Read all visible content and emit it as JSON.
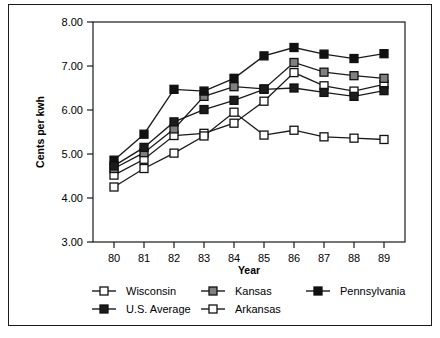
{
  "chart_data": {
    "type": "line",
    "title": "",
    "xlabel": "Year",
    "ylabel": "Cents per kwh",
    "categories": [
      "80",
      "81",
      "82",
      "83",
      "84",
      "85",
      "86",
      "87",
      "88",
      "89"
    ],
    "xlim": [
      0,
      9
    ],
    "ylim": [
      3.0,
      8.0
    ],
    "ytick_labels": [
      "3.00",
      "4.00",
      "5.00",
      "6.00",
      "7.00",
      "8.00"
    ],
    "ytick_values": [
      3.0,
      4.0,
      5.0,
      6.0,
      7.0,
      8.0
    ],
    "grid": false,
    "legend_position": "bottom",
    "series": [
      {
        "name": "Wisconsin",
        "marker": "open-square",
        "fill": "#ffffff",
        "values": [
          4.52,
          4.88,
          5.42,
          5.47,
          5.7,
          6.2,
          6.85,
          6.55,
          6.43,
          6.58
        ]
      },
      {
        "name": "Kansas",
        "marker": "gray-square",
        "fill": "#808080",
        "values": [
          4.67,
          5.03,
          5.57,
          6.31,
          6.53,
          6.48,
          7.08,
          6.86,
          6.78,
          6.72
        ]
      },
      {
        "name": "Pennsylvania",
        "marker": "black-square",
        "fill": "#111111",
        "values": [
          4.86,
          5.45,
          6.47,
          6.43,
          6.72,
          7.23,
          7.42,
          7.27,
          7.17,
          7.28
        ]
      },
      {
        "name": "U.S. Average",
        "marker": "dark-square",
        "fill": "#1c1c1c",
        "values": [
          4.73,
          5.15,
          5.73,
          6.01,
          6.22,
          6.47,
          6.5,
          6.4,
          6.31,
          6.44
        ]
      },
      {
        "name": "Arkansas",
        "marker": "open-square",
        "fill": "#ffffff",
        "values": [
          4.25,
          4.67,
          5.02,
          5.41,
          5.95,
          5.43,
          5.54,
          5.39,
          5.36,
          5.33
        ]
      }
    ]
  },
  "legend": {
    "entries": [
      {
        "label": "Wisconsin"
      },
      {
        "label": "Kansas"
      },
      {
        "label": "Pennsylvania"
      },
      {
        "label": "U.S. Average"
      },
      {
        "label": "Arkansas"
      }
    ]
  },
  "axes": {
    "y_title": "Cents per kwh",
    "x_title": "Year"
  },
  "colors": {
    "axis": "#1a1a1a",
    "line": "#1a1a1a",
    "background": "#ffffff",
    "gray_fill": "#808080",
    "dark_fill": "#1c1c1c",
    "black_fill": "#111111",
    "white_fill": "#ffffff"
  }
}
